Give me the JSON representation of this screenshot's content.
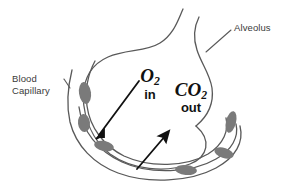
{
  "figure": {
    "type": "biology-diagram",
    "width": 292,
    "height": 191,
    "background_color": "#ffffff",
    "outline_color": "#595959",
    "cell_fill_color": "#7a7a7a",
    "arrow_color": "#111111",
    "label_color": "#3a3a3a"
  },
  "labels": {
    "blood_capillary": "Blood\nCapillary",
    "alveolus": "Alveolus"
  },
  "gases": {
    "oxygen": {
      "element": "O",
      "subscript": "2",
      "direction": "in"
    },
    "carbon_dioxide": {
      "element": "CO",
      "subscript": "2",
      "direction": "out"
    }
  },
  "arrows": [
    {
      "name": "oxygen-arrow",
      "meaning": "O2 diffuses into blood capillary",
      "from": [
        139,
        81
      ],
      "to": [
        96,
        139
      ]
    },
    {
      "name": "carbon-dioxide-arrow",
      "meaning": "CO2 diffuses out into alveolus",
      "from": [
        137,
        169
      ],
      "to": [
        169,
        131
      ]
    }
  ],
  "blood_cells": [
    {
      "cx": 85,
      "cy": 93,
      "rx": 6,
      "ry": 11,
      "rot": -8
    },
    {
      "cx": 84,
      "cy": 123,
      "rx": 6,
      "ry": 9,
      "rot": -6
    },
    {
      "cx": 104,
      "cy": 146,
      "rx": 10,
      "ry": 5,
      "rot": 12
    },
    {
      "cx": 231,
      "cy": 122,
      "rx": 5,
      "ry": 11,
      "rot": 14
    },
    {
      "cx": 224,
      "cy": 153,
      "rx": 10,
      "ry": 5,
      "rot": 18
    },
    {
      "cx": 186,
      "cy": 170,
      "rx": 11,
      "ry": 5,
      "rot": 5
    }
  ]
}
